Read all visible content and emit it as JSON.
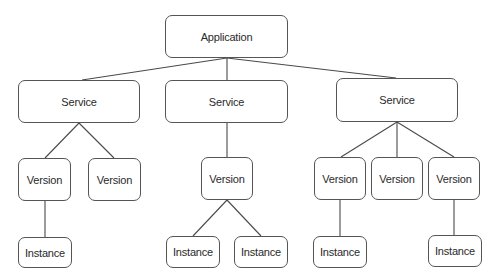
{
  "diagram": {
    "type": "tree",
    "colors": {
      "border": "#555555",
      "edge": "#4a4a4a",
      "text": "#2a2a2a",
      "background": "#ffffff"
    },
    "root": {
      "id": "app",
      "label": "Application"
    },
    "nodes": [
      {
        "id": "app",
        "label": "Application",
        "level": 0,
        "x": 165,
        "y": 15,
        "w": 123,
        "h": 43
      },
      {
        "id": "svc1",
        "label": "Service",
        "level": 1,
        "x": 18,
        "y": 80,
        "w": 122,
        "h": 43
      },
      {
        "id": "svc2",
        "label": "Service",
        "level": 1,
        "x": 165,
        "y": 80,
        "w": 123,
        "h": 43
      },
      {
        "id": "svc3",
        "label": "Service",
        "level": 1,
        "x": 336,
        "y": 78,
        "w": 122,
        "h": 44
      },
      {
        "id": "v1",
        "label": "Version",
        "level": 2,
        "x": 18,
        "y": 158,
        "w": 53,
        "h": 43
      },
      {
        "id": "v2",
        "label": "Version",
        "level": 2,
        "x": 88,
        "y": 158,
        "w": 53,
        "h": 43
      },
      {
        "id": "v3",
        "label": "Version",
        "level": 2,
        "x": 201,
        "y": 157,
        "w": 52,
        "h": 43
      },
      {
        "id": "v4",
        "label": "Version",
        "level": 2,
        "x": 314,
        "y": 157,
        "w": 52,
        "h": 43
      },
      {
        "id": "v5",
        "label": "Version",
        "level": 2,
        "x": 371,
        "y": 157,
        "w": 52,
        "h": 43
      },
      {
        "id": "v6",
        "label": "Version",
        "level": 2,
        "x": 428,
        "y": 157,
        "w": 52,
        "h": 43
      },
      {
        "id": "i1",
        "label": "Instance",
        "level": 3,
        "x": 18,
        "y": 237,
        "w": 54,
        "h": 31
      },
      {
        "id": "i2",
        "label": "Instance",
        "level": 3,
        "x": 166,
        "y": 236,
        "w": 54,
        "h": 32
      },
      {
        "id": "i3",
        "label": "Instance",
        "level": 3,
        "x": 234,
        "y": 236,
        "w": 54,
        "h": 32
      },
      {
        "id": "i4",
        "label": "Instance",
        "level": 3,
        "x": 313,
        "y": 236,
        "w": 54,
        "h": 32
      },
      {
        "id": "i5",
        "label": "Instance",
        "level": 3,
        "x": 428,
        "y": 235,
        "w": 54,
        "h": 32
      }
    ],
    "edges": [
      {
        "from": "app",
        "to": "svc1",
        "x1": 227,
        "y1": 58,
        "x2": 82,
        "y2": 80
      },
      {
        "from": "app",
        "to": "svc2",
        "x1": 227,
        "y1": 58,
        "x2": 227,
        "y2": 80
      },
      {
        "from": "app",
        "to": "svc3",
        "x1": 227,
        "y1": 58,
        "x2": 396,
        "y2": 78
      },
      {
        "from": "svc1",
        "to": "v1",
        "x1": 79,
        "y1": 123,
        "x2": 45,
        "y2": 158
      },
      {
        "from": "svc1",
        "to": "v2",
        "x1": 79,
        "y1": 123,
        "x2": 114,
        "y2": 158
      },
      {
        "from": "svc2",
        "to": "v3",
        "x1": 227,
        "y1": 123,
        "x2": 227,
        "y2": 157
      },
      {
        "from": "svc3",
        "to": "v4",
        "x1": 397,
        "y1": 122,
        "x2": 341,
        "y2": 157
      },
      {
        "from": "svc3",
        "to": "v5",
        "x1": 397,
        "y1": 122,
        "x2": 397,
        "y2": 157
      },
      {
        "from": "svc3",
        "to": "v6",
        "x1": 397,
        "y1": 122,
        "x2": 454,
        "y2": 157
      },
      {
        "from": "v1",
        "to": "i1",
        "x1": 45,
        "y1": 201,
        "x2": 45,
        "y2": 237
      },
      {
        "from": "v3",
        "to": "i2",
        "x1": 227,
        "y1": 200,
        "x2": 193,
        "y2": 236
      },
      {
        "from": "v3",
        "to": "i3",
        "x1": 227,
        "y1": 200,
        "x2": 261,
        "y2": 236
      },
      {
        "from": "v4",
        "to": "i4",
        "x1": 340,
        "y1": 200,
        "x2": 340,
        "y2": 236
      },
      {
        "from": "v6",
        "to": "i5",
        "x1": 454,
        "y1": 200,
        "x2": 454,
        "y2": 235
      }
    ]
  }
}
